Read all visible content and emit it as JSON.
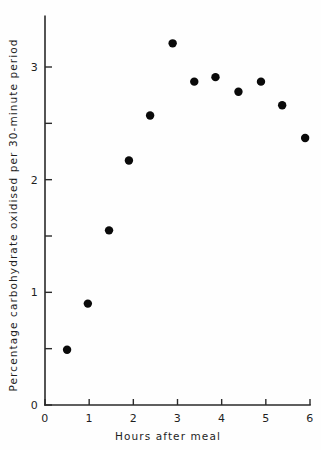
{
  "chart_data": {
    "type": "scatter",
    "title": "",
    "xlabel": "Hours  after  meal",
    "ylabel": "Percentage carbohydrate oxidised per 30-minute period",
    "xlim": [
      0,
      6
    ],
    "ylim": [
      0,
      3.45
    ],
    "grid": false,
    "legend": false,
    "xticks": [
      0,
      1,
      2,
      3,
      4,
      5,
      6
    ],
    "xtick_labels": [
      "0",
      "1",
      "2",
      "3",
      "4",
      "5",
      "6"
    ],
    "yticks": [
      0,
      0.5,
      1,
      1.5,
      2,
      2.5,
      3
    ],
    "ytick_labels": [
      "0",
      "",
      "1",
      "",
      "2",
      "",
      "3"
    ],
    "x": [
      0.5,
      0.97,
      1.45,
      1.9,
      2.38,
      2.89,
      3.38,
      3.86,
      4.38,
      4.89,
      5.37,
      5.89
    ],
    "y": [
      0.49,
      0.9,
      1.55,
      2.17,
      2.57,
      3.21,
      2.87,
      2.91,
      2.78,
      2.87,
      2.66,
      2.37
    ],
    "marker": "circle",
    "marker_color": "#0a0a0a",
    "marker_size": 6
  },
  "axis": {
    "x_label_text": "Hours  after  meal",
    "y_label_text": "Percentage carbohydrate oxidised per 30-minute period"
  }
}
